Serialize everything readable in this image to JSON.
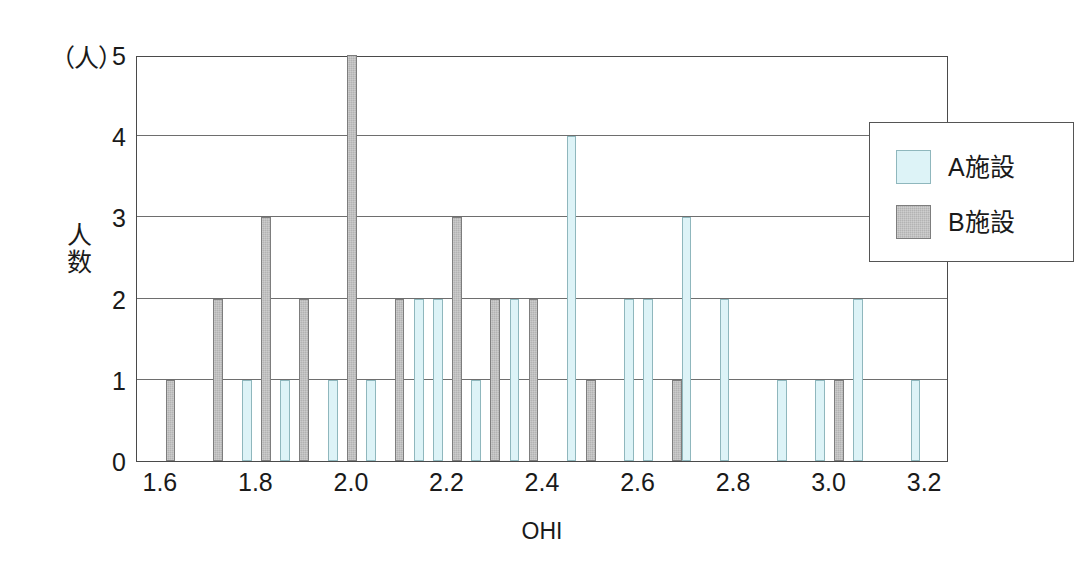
{
  "chart_data": {
    "type": "bar",
    "title": "",
    "subtitle": "",
    "xlabel": "OHI",
    "ylabel": "人数",
    "unit_label": "（人）",
    "xlim": [
      1.55,
      3.25
    ],
    "ylim": [
      0,
      5
    ],
    "grid": true,
    "grid_axis": "y",
    "legend_position": "top-right",
    "bin_width": 0.02,
    "x_tick_labels": [
      "1.6",
      "1.8",
      "2.0",
      "2.2",
      "2.4",
      "2.6",
      "2.8",
      "3.0",
      "3.2"
    ],
    "x_tick_values": [
      1.6,
      1.8,
      2.0,
      2.2,
      2.4,
      2.6,
      2.8,
      3.0,
      3.2
    ],
    "y_tick_labels": [
      "0",
      "1",
      "2",
      "3",
      "4",
      "5"
    ],
    "y_tick_values": [
      0,
      1,
      2,
      3,
      4,
      5
    ],
    "series": [
      {
        "name": "A施設",
        "color": "#ddf3f7",
        "border_color": "#8fb7bd",
        "bins": [
          {
            "x": 1.78,
            "value": 1
          },
          {
            "x": 1.86,
            "value": 1
          },
          {
            "x": 1.96,
            "value": 1
          },
          {
            "x": 2.04,
            "value": 1
          },
          {
            "x": 2.14,
            "value": 2
          },
          {
            "x": 2.18,
            "value": 2
          },
          {
            "x": 2.26,
            "value": 1
          },
          {
            "x": 2.34,
            "value": 2
          },
          {
            "x": 2.46,
            "value": 4
          },
          {
            "x": 2.58,
            "value": 2
          },
          {
            "x": 2.62,
            "value": 2
          },
          {
            "x": 2.7,
            "value": 3
          },
          {
            "x": 2.78,
            "value": 2
          },
          {
            "x": 2.9,
            "value": 1
          },
          {
            "x": 2.98,
            "value": 1
          },
          {
            "x": 3.06,
            "value": 2
          },
          {
            "x": 3.18,
            "value": 1
          }
        ]
      },
      {
        "name": "B施設",
        "color": "#b3b3b3",
        "border_color": "#7d7d7d",
        "bins": [
          {
            "x": 1.62,
            "value": 1
          },
          {
            "x": 1.72,
            "value": 2
          },
          {
            "x": 1.82,
            "value": 3
          },
          {
            "x": 1.9,
            "value": 2
          },
          {
            "x": 2.0,
            "value": 5
          },
          {
            "x": 2.1,
            "value": 2
          },
          {
            "x": 2.22,
            "value": 3
          },
          {
            "x": 2.3,
            "value": 2
          },
          {
            "x": 2.38,
            "value": 2
          },
          {
            "x": 2.5,
            "value": 1
          },
          {
            "x": 2.68,
            "value": 1
          },
          {
            "x": 3.02,
            "value": 1
          }
        ]
      }
    ]
  },
  "legend": {
    "items": [
      {
        "label": "A施設",
        "swatch": "series-a"
      },
      {
        "label": "B施設",
        "swatch": "series-b"
      }
    ]
  },
  "axes": {
    "y_title_chars": [
      "人",
      "数"
    ],
    "unit": "（人）",
    "x_title": "OHI"
  }
}
